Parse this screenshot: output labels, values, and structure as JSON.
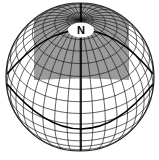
{
  "diagram": {
    "type": "orthographic-globe",
    "pole_label": "N",
    "graticule_step_deg": 10,
    "view": {
      "center_x": 80,
      "center_y": 77,
      "radius": 74,
      "view_lat_deg": 39.5
    },
    "shaded_region": {
      "description": "Gray rectangular area around the north pole",
      "color": "#8a8a8a",
      "opacity": 0.85,
      "bounds": {
        "left": 34,
        "right": 129,
        "top": 3,
        "bottom": 80
      }
    },
    "pole_marker": {
      "cx": 81,
      "cy": 30,
      "rx": 13,
      "ry": 7.5,
      "fill": "#ffffff"
    },
    "thick_lines": [
      {
        "name": "upper-circle",
        "points": [
          [
            7,
            74
          ],
          [
            81,
            30
          ],
          [
            153,
            74
          ]
        ]
      },
      {
        "name": "lower-circle",
        "points": [
          [
            7,
            84
          ],
          [
            81,
            129
          ],
          [
            153,
            84
          ]
        ]
      },
      {
        "name": "central-meridian",
        "points": [
          [
            81,
            3
          ],
          [
            81,
            151
          ]
        ]
      }
    ],
    "colors": {
      "grid": "#1a1a1a",
      "thick": "#000000",
      "outline": "#222222",
      "background": "#ffffff"
    }
  }
}
